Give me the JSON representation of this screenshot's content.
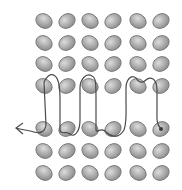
{
  "diagram": {
    "type": "bead-weaving-thread-path",
    "grid": {
      "columns_x": [
        44,
        67,
        90,
        113,
        138,
        161
      ],
      "rows_y": [
        21,
        43,
        64,
        86,
        129,
        151,
        173
      ],
      "bead_rx": 8.5,
      "bead_ry": 7,
      "bead_tilt_deg": -30
    },
    "colors": {
      "background": "#ffffff",
      "bead_fill": "#a8a8a8",
      "bead_highlight": "#d6d6d6",
      "bead_stroke": "#6e6e6e",
      "thread": "#4a4a4a"
    },
    "thread": {
      "start_marker": "dot at bottom-right bead (col 6, row 5)",
      "end_marker": "arrow pointing left",
      "description": "Thread weaves up and down between row 4 and row 5, looping over bead pairs in row 4, exiting left of row 5"
    }
  }
}
